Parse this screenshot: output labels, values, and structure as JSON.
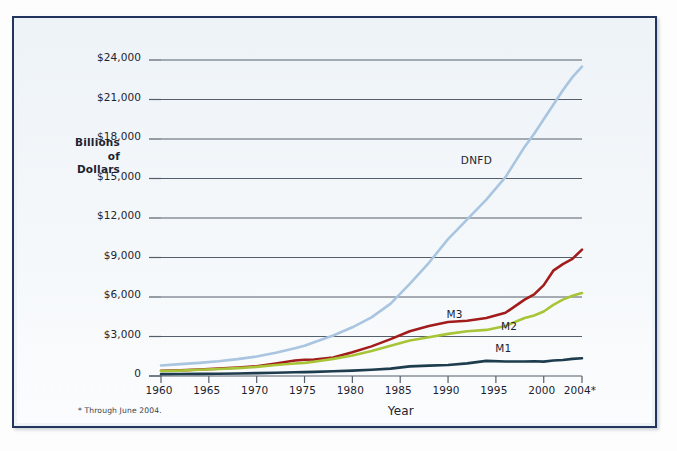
{
  "figure": {
    "background_color": "#eef3f8",
    "border_color": "#22355c",
    "axis_title_y_line1": "Billions",
    "axis_title_y_line2": "of",
    "axis_title_y_line3": "Dollars",
    "axis_title_x": "Year",
    "footnote": "* Through June 2004."
  },
  "chart_data": {
    "type": "line",
    "title": "",
    "subtitle": "",
    "xlabel": "Year",
    "ylabel": "Billions of Dollars",
    "xlim": [
      1960,
      2004
    ],
    "ylim": [
      0,
      24000
    ],
    "grid": true,
    "grid_color": "#555f6b",
    "legend_position": "inline-annotations",
    "x_ticks": [
      1960,
      1965,
      1970,
      1975,
      1980,
      1985,
      1990,
      1995,
      2000,
      2004
    ],
    "x_tick_labels": [
      "1960",
      "1965",
      "1970",
      "1975",
      "1980",
      "1985",
      "1990",
      "1995",
      "2000",
      "2004*"
    ],
    "y_ticks": [
      0,
      3000,
      6000,
      9000,
      12000,
      15000,
      18000,
      21000,
      24000
    ],
    "y_tick_labels": [
      "0",
      "$3,000",
      "$6,000",
      "$9,000",
      "$12,000",
      "$15,000",
      "$18,000",
      "$21,000",
      "$24,000"
    ],
    "annotations": [
      {
        "text": "DNFD",
        "x": 1993.0,
        "y": 16200
      },
      {
        "text": "M3",
        "x": 1991.5,
        "y": 4450
      },
      {
        "text": "M2",
        "x": 1997.2,
        "y": 3550
      },
      {
        "text": "M1",
        "x": 1996.6,
        "y": 1900
      }
    ],
    "x": [
      1960,
      1962,
      1964,
      1966,
      1968,
      1970,
      1972,
      1974,
      1975,
      1976,
      1978,
      1980,
      1982,
      1984,
      1986,
      1988,
      1990,
      1992,
      1994,
      1996,
      1998,
      1999,
      2000,
      2001,
      2002,
      2003,
      2004
    ],
    "series": [
      {
        "name": "DNFD",
        "color": "#a9c5e0",
        "values": [
          800,
          900,
          1000,
          1120,
          1280,
          1480,
          1760,
          2100,
          2300,
          2560,
          3080,
          3700,
          4450,
          5500,
          7000,
          8600,
          10400,
          11900,
          13400,
          15100,
          17400,
          18400,
          19500,
          20600,
          21700,
          22700,
          23500
        ]
      },
      {
        "name": "M3",
        "color": "#a21c1c",
        "values": [
          400,
          430,
          490,
          560,
          640,
          740,
          950,
          1180,
          1230,
          1250,
          1400,
          1800,
          2250,
          2800,
          3400,
          3800,
          4100,
          4200,
          4400,
          4800,
          5800,
          6200,
          6900,
          8000,
          8500,
          8900,
          9600
        ]
      },
      {
        "name": "M2",
        "color": "#a8c437",
        "values": [
          380,
          410,
          470,
          530,
          600,
          690,
          830,
          950,
          1000,
          1080,
          1300,
          1550,
          1900,
          2300,
          2700,
          2950,
          3200,
          3400,
          3500,
          3800,
          4400,
          4600,
          4900,
          5400,
          5800,
          6100,
          6300
        ]
      },
      {
        "name": "M1",
        "color": "#1d3c4e",
        "values": [
          140,
          150,
          160,
          175,
          195,
          220,
          250,
          280,
          295,
          310,
          360,
          410,
          480,
          560,
          730,
          790,
          830,
          960,
          1150,
          1100,
          1100,
          1120,
          1090,
          1180,
          1220,
          1300,
          1350
        ]
      }
    ]
  }
}
